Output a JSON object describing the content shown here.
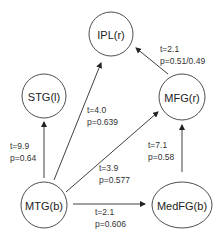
{
  "nodes": {
    "ipl": {
      "label": "IPL(r)"
    },
    "stg": {
      "label": "STG(l)"
    },
    "mfg": {
      "label": "MFG(r)"
    },
    "mtg": {
      "label": "MTG(b)"
    },
    "medfg": {
      "label": "MedFG(b)"
    }
  },
  "edges": {
    "mtg_stg": {
      "from": "MTG(b)",
      "to": "STG(l)",
      "t": "t=9.9",
      "p": "p=0.64"
    },
    "mtg_ipl": {
      "from": "MTG(b)",
      "to": "IPL(r)",
      "t": "t=4.0",
      "p": "p=0.639"
    },
    "mtg_mfg": {
      "from": "MTG(b)",
      "to": "MFG(r)",
      "t": "t=3.9",
      "p": "p=0.577"
    },
    "mtg_medfg": {
      "from": "MTG(b)",
      "to": "MedFG(b)",
      "t": "t=2.1",
      "p": "p=0.606"
    },
    "medfg_mfg": {
      "from": "MedFG(b)",
      "to": "MFG(r)",
      "t": "t=7.1",
      "p": "p=0.58"
    },
    "mfg_ipl": {
      "from": "MFG(r)",
      "to": "IPL(r)",
      "t": "t=2.1",
      "p": "p=0.51/0.49"
    }
  }
}
